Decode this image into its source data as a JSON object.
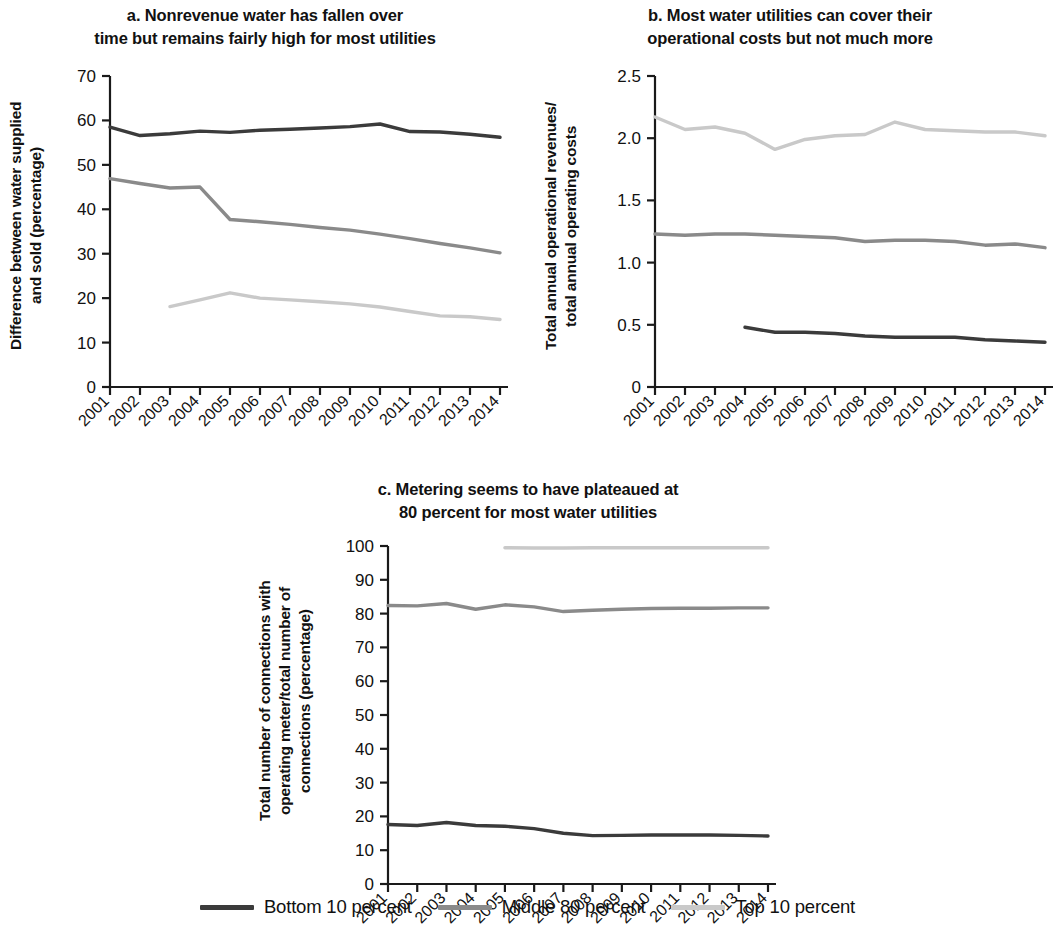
{
  "figure": {
    "legend": {
      "items": [
        {
          "label": "Bottom 10 percent",
          "color": "#3b3b3b",
          "key": "bottom10"
        },
        {
          "label": "Middle 80 percent",
          "color": "#8a8a8a",
          "key": "middle80"
        },
        {
          "label": "Top 10 percent",
          "color": "#c9c9c9",
          "key": "top10"
        }
      ]
    }
  },
  "chart_data": [
    {
      "id": "panel-a",
      "type": "line",
      "title": "a. Nonrevenue water has fallen over\ntime but remains fairly high for most utilities",
      "xlabel": "",
      "ylabel": "Difference between water supplied\nand sold (percentage)",
      "x": [
        "2001",
        "2002",
        "2003",
        "2004",
        "2005",
        "2006",
        "2007",
        "2008",
        "2009",
        "2010",
        "2011",
        "2012",
        "2013",
        "2014"
      ],
      "ylim": [
        0,
        70
      ],
      "yticks": [
        0,
        10,
        20,
        30,
        40,
        50,
        60,
        70
      ],
      "grid": false,
      "legend_position": "figure-bottom",
      "series": [
        {
          "name": "Bottom 10 percent",
          "color": "#3b3b3b",
          "values": [
            58.5,
            56.6,
            57.0,
            57.6,
            57.3,
            57.8,
            58.0,
            58.3,
            58.6,
            59.2,
            57.5,
            57.4,
            56.9,
            56.2
          ]
        },
        {
          "name": "Middle 80 percent",
          "color": "#8a8a8a",
          "values": [
            46.9,
            45.8,
            44.8,
            45.0,
            37.7,
            37.2,
            36.6,
            35.9,
            35.3,
            34.4,
            33.4,
            32.3,
            31.3,
            30.2
          ]
        },
        {
          "name": "Top 10 percent",
          "color": "#c9c9c9",
          "values": [
            null,
            null,
            18.1,
            19.6,
            21.2,
            20.0,
            19.6,
            19.2,
            18.7,
            18.0,
            17.0,
            16.0,
            15.8,
            15.2
          ]
        }
      ]
    },
    {
      "id": "panel-b",
      "type": "line",
      "title": "b. Most water utilities can cover their\noperational costs but not much more",
      "xlabel": "",
      "ylabel": "Total annual operational revenues/\ntotal annual operating costs",
      "x": [
        "2001",
        "2002",
        "2003",
        "2004",
        "2005",
        "2006",
        "2007",
        "2008",
        "2009",
        "2010",
        "2011",
        "2012",
        "2013",
        "2014"
      ],
      "ylim": [
        0,
        2.5
      ],
      "yticks": [
        0,
        0.5,
        1.0,
        1.5,
        2.0,
        2.5
      ],
      "ytick_labels": [
        "0",
        "0.5",
        "1.0",
        "1.5",
        "2.0",
        "2.5"
      ],
      "grid": false,
      "legend_position": "figure-bottom",
      "series": [
        {
          "name": "Bottom 10 percent",
          "color": "#3b3b3b",
          "values": [
            null,
            null,
            null,
            0.48,
            0.44,
            0.44,
            0.43,
            0.41,
            0.4,
            0.4,
            0.4,
            0.38,
            0.37,
            0.36
          ]
        },
        {
          "name": "Middle 80 percent",
          "color": "#8a8a8a",
          "values": [
            1.23,
            1.22,
            1.23,
            1.23,
            1.22,
            1.21,
            1.2,
            1.17,
            1.18,
            1.18,
            1.17,
            1.14,
            1.15,
            1.12
          ]
        },
        {
          "name": "Top 10 percent",
          "color": "#c9c9c9",
          "values": [
            2.17,
            2.07,
            2.09,
            2.04,
            1.91,
            1.99,
            2.02,
            2.03,
            2.13,
            2.07,
            2.06,
            2.05,
            2.05,
            2.02
          ]
        }
      ]
    },
    {
      "id": "panel-c",
      "type": "line",
      "title": "c. Metering seems to have plateaued at\n80 percent for most water utilities",
      "xlabel": "",
      "ylabel": "Total number of connections  with\noperating meter/total number of\nconnections (percentage)",
      "x": [
        "2001",
        "2002",
        "2003",
        "2004",
        "2005",
        "2006",
        "2007",
        "2008",
        "2009",
        "2010",
        "2011",
        "2012",
        "2013",
        "2014"
      ],
      "ylim": [
        0,
        100
      ],
      "yticks": [
        0,
        10,
        20,
        30,
        40,
        50,
        60,
        70,
        80,
        90,
        100
      ],
      "grid": false,
      "legend_position": "figure-bottom",
      "series": [
        {
          "name": "Bottom 10 percent",
          "color": "#3b3b3b",
          "values": [
            17.6,
            17.3,
            18.2,
            17.3,
            17.1,
            16.4,
            15.0,
            14.3,
            14.4,
            14.5,
            14.5,
            14.5,
            14.4,
            14.2
          ]
        },
        {
          "name": "Middle 80 percent",
          "color": "#8a8a8a",
          "values": [
            82.4,
            82.3,
            83.0,
            81.3,
            82.6,
            82.0,
            80.6,
            81.0,
            81.3,
            81.5,
            81.6,
            81.6,
            81.7,
            81.7
          ]
        },
        {
          "name": "Top 10 percent",
          "color": "#c9c9c9",
          "values": [
            null,
            null,
            null,
            null,
            99.5,
            99.4,
            99.4,
            99.5,
            99.5,
            99.5,
            99.5,
            99.5,
            99.5,
            99.5
          ]
        }
      ]
    }
  ]
}
